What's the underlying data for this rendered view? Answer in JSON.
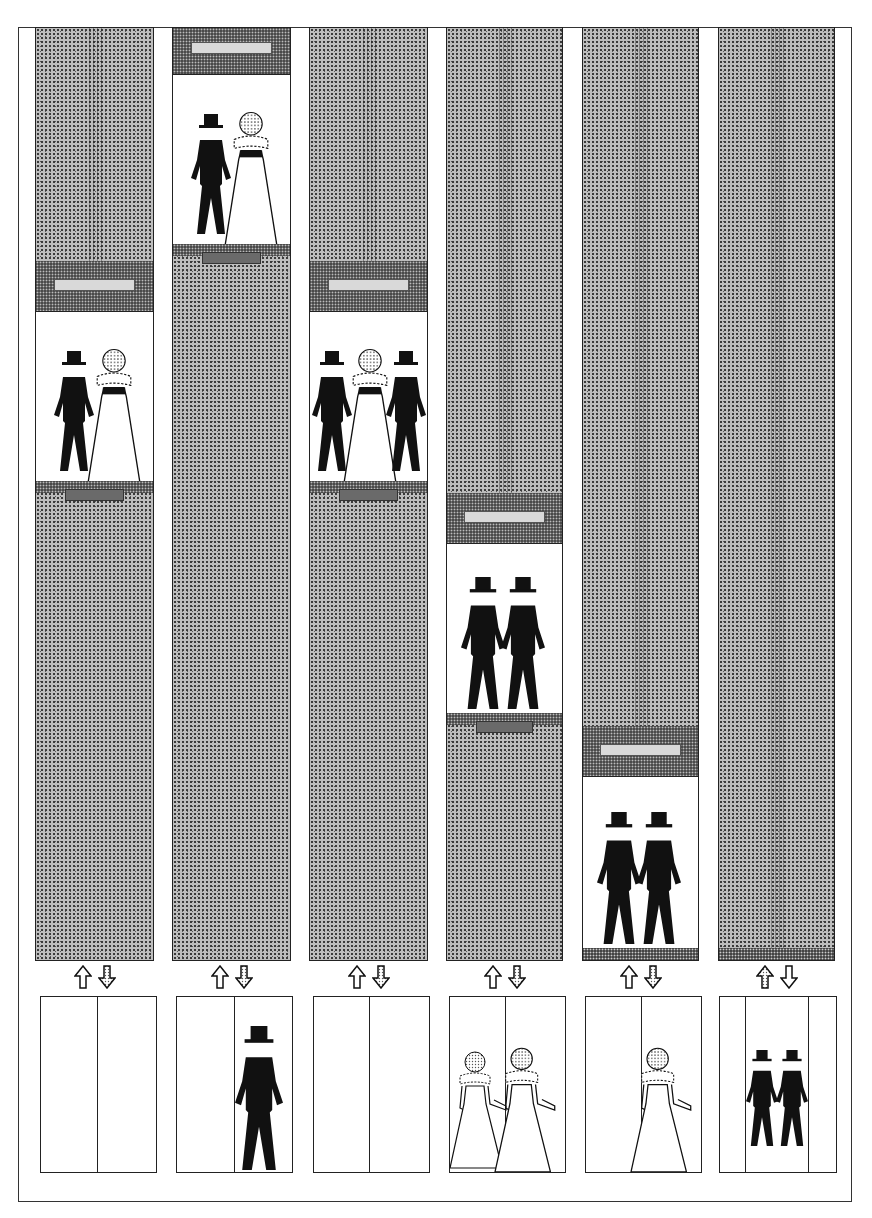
{
  "illustration": {
    "title": "Elevator shafts illustration",
    "colors": {
      "ink": "#111111",
      "stipple_light": "#bdbdbd",
      "stipple_dark": "#4a4a4a",
      "paper": "#ffffff"
    },
    "columns": [
      {
        "index": 1,
        "car_position": "upper-middle",
        "car_occupants": [
          "groom",
          "bride"
        ],
        "arrow_up": "outline",
        "arrow_down": "lit",
        "door_state": "closed",
        "waiting": []
      },
      {
        "index": 2,
        "car_position": "top",
        "car_occupants": [
          "groom",
          "bride"
        ],
        "arrow_up": "outline",
        "arrow_down": "lit",
        "door_state": "closed",
        "waiting": [
          "groom"
        ]
      },
      {
        "index": 3,
        "car_position": "upper-middle",
        "car_occupants": [
          "groom",
          "bride",
          "groom"
        ],
        "arrow_up": "outline",
        "arrow_down": "lit",
        "door_state": "closed",
        "waiting": []
      },
      {
        "index": 4,
        "car_position": "middle",
        "car_occupants": [
          "groom",
          "groom"
        ],
        "arrow_up": "outline",
        "arrow_down": "lit",
        "door_state": "closed",
        "waiting": [
          "bride",
          "bride"
        ]
      },
      {
        "index": 5,
        "car_position": "lower",
        "car_occupants": [
          "groom",
          "groom"
        ],
        "arrow_up": "outline",
        "arrow_down": "lit",
        "door_state": "closed",
        "waiting": [
          "bride"
        ]
      },
      {
        "index": 6,
        "car_position": "ground",
        "car_occupants": [
          "groom",
          "groom"
        ],
        "arrow_up": "lit",
        "arrow_down": "outline",
        "door_state": "open",
        "waiting": []
      }
    ]
  },
  "caption": {
    "text": ""
  }
}
